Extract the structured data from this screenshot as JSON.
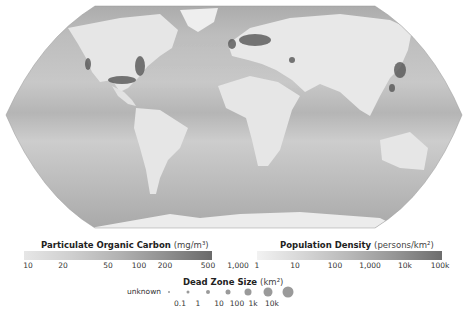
{
  "map": {
    "projection": "robinson-like",
    "colors": {
      "ocean_light": "#cfcfcf",
      "ocean_mid": "#b6b6b6",
      "ocean_dark": "#a5a5a5",
      "land": "#e8e8e8",
      "high_density": "#4a4a4a"
    }
  },
  "legend_poc": {
    "title": "Particulate Organic Carbon",
    "unit": "(mg/m³)",
    "ticks": [
      "10",
      "20",
      "50",
      "100",
      "200",
      "500",
      "1,000"
    ],
    "tick_pos": [
      10,
      45,
      90,
      121,
      147,
      190,
      220
    ],
    "gradient": [
      "#e6e6e6",
      "#cfcfcf",
      "#b3b3b3",
      "#909090",
      "#6a6a6a"
    ]
  },
  "legend_pop": {
    "title": "Population Density",
    "unit": "(persons/km²)",
    "ticks": [
      "1",
      "10",
      "100",
      "1,000",
      "10k",
      "100k"
    ],
    "tick_pos": [
      22,
      60,
      100,
      135,
      170,
      205
    ],
    "gradient": [
      "#f2f2f2",
      "#d6d6d6",
      "#b8b8b8",
      "#959595",
      "#6d6d6d"
    ]
  },
  "legend_deadzone": {
    "title": "Dead Zone Size",
    "unit": "(km²)",
    "unknown_label": "unknown",
    "ticks": [
      "0.1",
      "1",
      "10",
      "100",
      "1k",
      "10k"
    ],
    "dot_sizes": [
      2,
      3,
      4,
      5,
      7,
      9,
      11
    ]
  }
}
